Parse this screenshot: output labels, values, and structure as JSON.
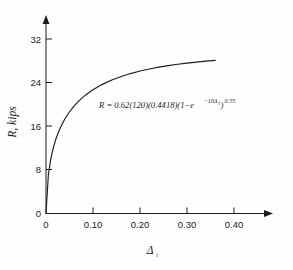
{
  "figure": {
    "background_color": "#fefefe",
    "ink_color": "#1c1c1c",
    "equation": {
      "lead": "R = 0.62(120)(0.4418)(1−e",
      "exp_minus_ten": "−10Δ",
      "exp_sub_i": "i",
      "close_paren": ")",
      "outer_exponent": "0.55",
      "full": "R = 0.62(120)(0.4418)(1−e^{−10Δi})^{0.55}"
    },
    "y_axis_title": "R, kips",
    "x_axis_title_symbol": "Δ",
    "x_axis_title_subscript": "i"
  },
  "chart_data": {
    "type": "line",
    "title": "",
    "xlabel": "Δi",
    "ylabel": "R, kips",
    "xlim": [
      0,
      0.44
    ],
    "ylim": [
      0,
      36
    ],
    "xticks": [
      0,
      0.1,
      0.2,
      0.3,
      0.4
    ],
    "xtick_labels": [
      "0",
      "0.10",
      "0.20",
      "0.30",
      "0.40"
    ],
    "yticks": [
      0,
      8,
      16,
      24,
      32
    ],
    "ytick_labels": [
      "0",
      "8",
      "16",
      "24",
      "32"
    ],
    "grid": false,
    "legend": null,
    "annotations": [
      {
        "text": "R = 0.62(120)(0.4418)(1−e^{−10Δi})^{0.55}",
        "x": 0.12,
        "y": 20.5
      }
    ],
    "series": [
      {
        "name": "R vs Δi",
        "equation": "R = 0.62*120*0.4418*(1-exp(-10*x))^0.55",
        "x": [
          0,
          0.005,
          0.01,
          0.015,
          0.02,
          0.025,
          0.03,
          0.04,
          0.05,
          0.06,
          0.07,
          0.08,
          0.09,
          0.1,
          0.12,
          0.14,
          0.16,
          0.18,
          0.2,
          0.22,
          0.24,
          0.26,
          0.28,
          0.3,
          0.32,
          0.34,
          0.36
        ],
        "y": [
          0.0,
          7.06,
          9.92,
          11.87,
          13.38,
          14.61,
          15.65,
          17.33,
          18.66,
          19.74,
          20.65,
          21.43,
          22.1,
          22.69,
          23.68,
          24.47,
          25.12,
          25.66,
          26.12,
          26.51,
          26.84,
          27.12,
          27.37,
          27.58,
          27.77,
          27.93,
          28.07
        ]
      }
    ]
  }
}
